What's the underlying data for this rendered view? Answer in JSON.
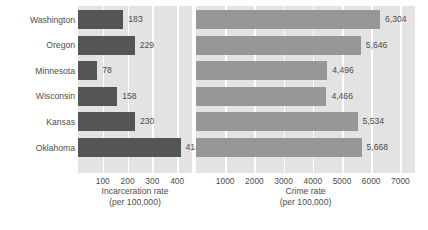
{
  "chart_data": {
    "type": "bar",
    "orientation": "horizontal",
    "title": "",
    "categories": [
      "Washington",
      "Oregon",
      "Minnesota",
      "Wisconsin",
      "Kansas",
      "Oklahoma"
    ],
    "panels": [
      {
        "name": "incarceration",
        "xlabel_line1": "Incarceration rate",
        "xlabel_line2": "(per 100,000)",
        "values": [
          183,
          229,
          78,
          158,
          230,
          414
        ],
        "value_labels": [
          "183",
          "229",
          "78",
          "158",
          "230",
          "414"
        ],
        "ticks": [
          100,
          200,
          300,
          400
        ],
        "tick_labels": [
          "100",
          "200",
          "300",
          "400"
        ],
        "xlim": [
          0,
          460
        ],
        "bar_color": "#555555",
        "panel_bg": "#e3e3e3",
        "grid": true,
        "grid_color": "#ffffff"
      },
      {
        "name": "crime",
        "xlabel_line1": "Crime rate",
        "xlabel_line2": "(per 100,000)",
        "values": [
          6304,
          5646,
          4496,
          4466,
          5534,
          5668
        ],
        "value_labels": [
          "6,304",
          "5,646",
          "4,496",
          "4,466",
          "5,534",
          "5,668"
        ],
        "ticks": [
          1000,
          2000,
          3000,
          4000,
          5000,
          6000,
          7000
        ],
        "tick_labels": [
          "1000",
          "2000",
          "3000",
          "4000",
          "5000",
          "6000",
          "7000"
        ],
        "xlim": [
          0,
          7500
        ],
        "bar_color": "#979797",
        "panel_bg": "#e3e3e3",
        "grid": true,
        "grid_color": "#ffffff"
      }
    ],
    "legend": "none",
    "ylabel": ""
  }
}
